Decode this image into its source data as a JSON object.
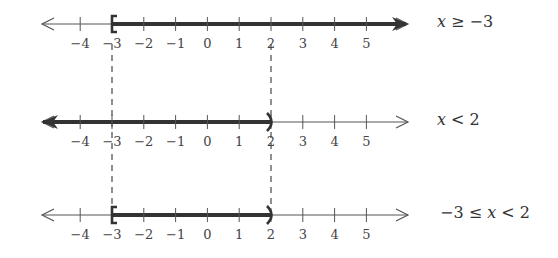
{
  "figure": {
    "axis": {
      "ticks": [
        -4,
        -3,
        -2,
        -1,
        0,
        1,
        2,
        3,
        4,
        5
      ],
      "tick_labels": [
        "−4",
        "−3",
        "−2",
        "−1",
        "0",
        "1",
        "2",
        "3",
        "4",
        "5"
      ]
    },
    "number_lines": [
      {
        "label": "x ≥ −3",
        "label_parts": {
          "lhs": "x",
          "op": " ≥ ",
          "rhs": "−3"
        },
        "shaded_from": -3,
        "shaded_to": "+infinity",
        "left_endpoint": "[",
        "right_endpoint": "arrow"
      },
      {
        "label": "x < 2",
        "label_parts": {
          "lhs": "x",
          "op": " < ",
          "rhs": "2"
        },
        "shaded_from": "-infinity",
        "shaded_to": 2,
        "left_endpoint": "arrow",
        "right_endpoint": ")"
      },
      {
        "label": "−3 ≤ x < 2",
        "label_parts": {
          "pre": "−3",
          "op1": " ≤ ",
          "var": "x",
          "op2": " < ",
          "rhs": "2"
        },
        "shaded_from": -3,
        "shaded_to": 2,
        "left_endpoint": "[",
        "right_endpoint": ")"
      }
    ],
    "dashed_guides": [
      -3,
      2
    ],
    "colors": {
      "line": "#555555",
      "shade": "#333333",
      "text": "#444444"
    }
  }
}
